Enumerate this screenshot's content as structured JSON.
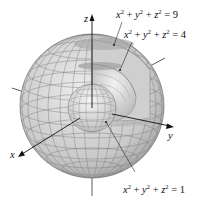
{
  "figure": {
    "axes": {
      "x": "x",
      "y": "y",
      "z": "z"
    },
    "labels": [
      {
        "id": "outer",
        "var1": "x",
        "var2": "y",
        "var3": "z",
        "exp": "2",
        "rhs": "9"
      },
      {
        "id": "middle",
        "var1": "x",
        "var2": "y",
        "var3": "z",
        "exp": "2",
        "rhs": "4"
      },
      {
        "id": "inner",
        "var1": "x",
        "var2": "y",
        "var3": "z",
        "exp": "2",
        "rhs": "1"
      }
    ],
    "spheres": [
      {
        "name": "outer",
        "radius_sq": 9
      },
      {
        "name": "middle",
        "radius_sq": 4
      },
      {
        "name": "inner",
        "radius_sq": 1
      }
    ],
    "colors": {
      "sphere_fill": "#d4d4d4",
      "sphere_dark": "#9a9a9a",
      "grid": "#6f6f6f",
      "axis": "#111111"
    }
  }
}
